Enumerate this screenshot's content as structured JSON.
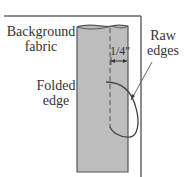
{
  "labels": {
    "background_fabric": [
      "Background",
      "fabric"
    ],
    "raw_edges": [
      "Raw",
      "edges"
    ],
    "folded_edge": [
      "Folded",
      "edge"
    ],
    "measurement": "1/4\""
  },
  "colors": {
    "fabric_fill": "#bdbdbd",
    "line": "#555555",
    "text": "#333333",
    "background": "#ffffff"
  }
}
